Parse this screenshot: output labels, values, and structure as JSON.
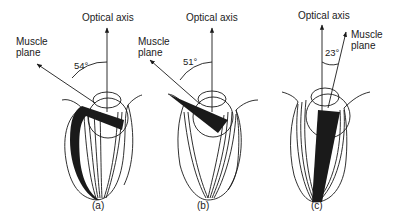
{
  "panels": [
    {
      "id": "a",
      "caption": "(a)",
      "optical_axis_label": "Optical axis",
      "muscle_plane_label_line1": "Muscle",
      "muscle_plane_label_line2": "plane",
      "angle_label": "54°",
      "angle_deg": 54
    },
    {
      "id": "b",
      "caption": "(b)",
      "optical_axis_label": "Optical axis",
      "muscle_plane_label_line1": "Muscle",
      "muscle_plane_label_line2": "plane",
      "angle_label": "51°",
      "angle_deg": 51
    },
    {
      "id": "c",
      "caption": "(c)",
      "optical_axis_label": "Optical axis",
      "muscle_plane_label_line1": "Muscle",
      "muscle_plane_label_line2": "plane",
      "angle_label": "23°",
      "angle_deg": 23
    }
  ],
  "colors": {
    "ink": "#1a1a1a",
    "background": "#ffffff"
  }
}
